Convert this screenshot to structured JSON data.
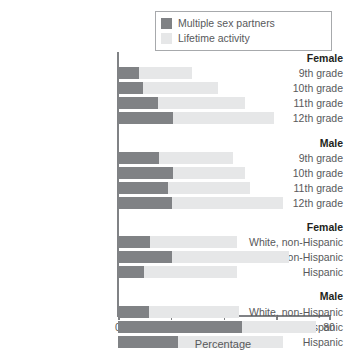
{
  "chart_data": {
    "type": "bar",
    "orientation": "horizontal",
    "stacked": false,
    "overlaid": true,
    "title": "",
    "xlabel": "Percentage",
    "ylabel": "",
    "xlim": [
      0,
      80
    ],
    "xticks": [
      0,
      20,
      40,
      60,
      80
    ],
    "xtick_labels": [
      "0",
      "20",
      "40",
      "60",
      "80"
    ],
    "grid": false,
    "legend_position": "top-right",
    "colors": {
      "multiple_sex_partners": "#808285",
      "lifetime_activity": "#e6e7e8",
      "axis": "#808285",
      "text": "#58595b",
      "heading_text": "#231f20",
      "legend_border": "#a7a9ac",
      "background": "#ffffff"
    },
    "series": [
      {
        "name": "Multiple sex partners",
        "color": "#808285"
      },
      {
        "name": "Lifetime activity",
        "color": "#e6e7e8"
      }
    ],
    "groups": [
      {
        "heading": "Female",
        "rows": [
          {
            "label": "9th grade",
            "multiple_sex_partners": 8.0,
            "lifetime_activity": 28.0
          },
          {
            "label": "10th grade",
            "multiple_sex_partners": 9.5,
            "lifetime_activity": 38.0
          },
          {
            "label": "11th grade",
            "multiple_sex_partners": 15.0,
            "lifetime_activity": 48.0
          },
          {
            "label": "12th grade",
            "multiple_sex_partners": 21.0,
            "lifetime_activity": 59.0
          }
        ]
      },
      {
        "heading": "Male",
        "rows": [
          {
            "label": "9th grade",
            "multiple_sex_partners": 15.5,
            "lifetime_activity": 43.5
          },
          {
            "label": "10th grade",
            "multiple_sex_partners": 21.0,
            "lifetime_activity": 48.0
          },
          {
            "label": "11th grade",
            "multiple_sex_partners": 19.0,
            "lifetime_activity": 50.0
          },
          {
            "label": "12th grade",
            "multiple_sex_partners": 20.5,
            "lifetime_activity": 62.5
          }
        ]
      },
      {
        "heading": "Female",
        "rows": [
          {
            "label": "White, non-Hispanic",
            "multiple_sex_partners": 12.0,
            "lifetime_activity": 45.0
          },
          {
            "label": "Black, non-Hispanic",
            "multiple_sex_partners": 20.5,
            "lifetime_activity": 65.0
          },
          {
            "label": "Hispanic",
            "multiple_sex_partners": 10.0,
            "lifetime_activity": 45.0
          }
        ]
      },
      {
        "heading": "Male",
        "rows": [
          {
            "label": "White, non-Hispanic",
            "multiple_sex_partners": 11.7,
            "lifetime_activity": 46.0
          },
          {
            "label": "Black, non-Hispanic",
            "multiple_sex_partners": 47.0,
            "lifetime_activity": 75.0
          },
          {
            "label": "Hispanic",
            "multiple_sex_partners": 22.7,
            "lifetime_activity": 62.5
          }
        ]
      }
    ]
  },
  "legend": {
    "items": [
      {
        "label": "Multiple sex partners",
        "color": "#808285"
      },
      {
        "label": "Lifetime activity",
        "color": "#e6e7e8"
      }
    ]
  }
}
